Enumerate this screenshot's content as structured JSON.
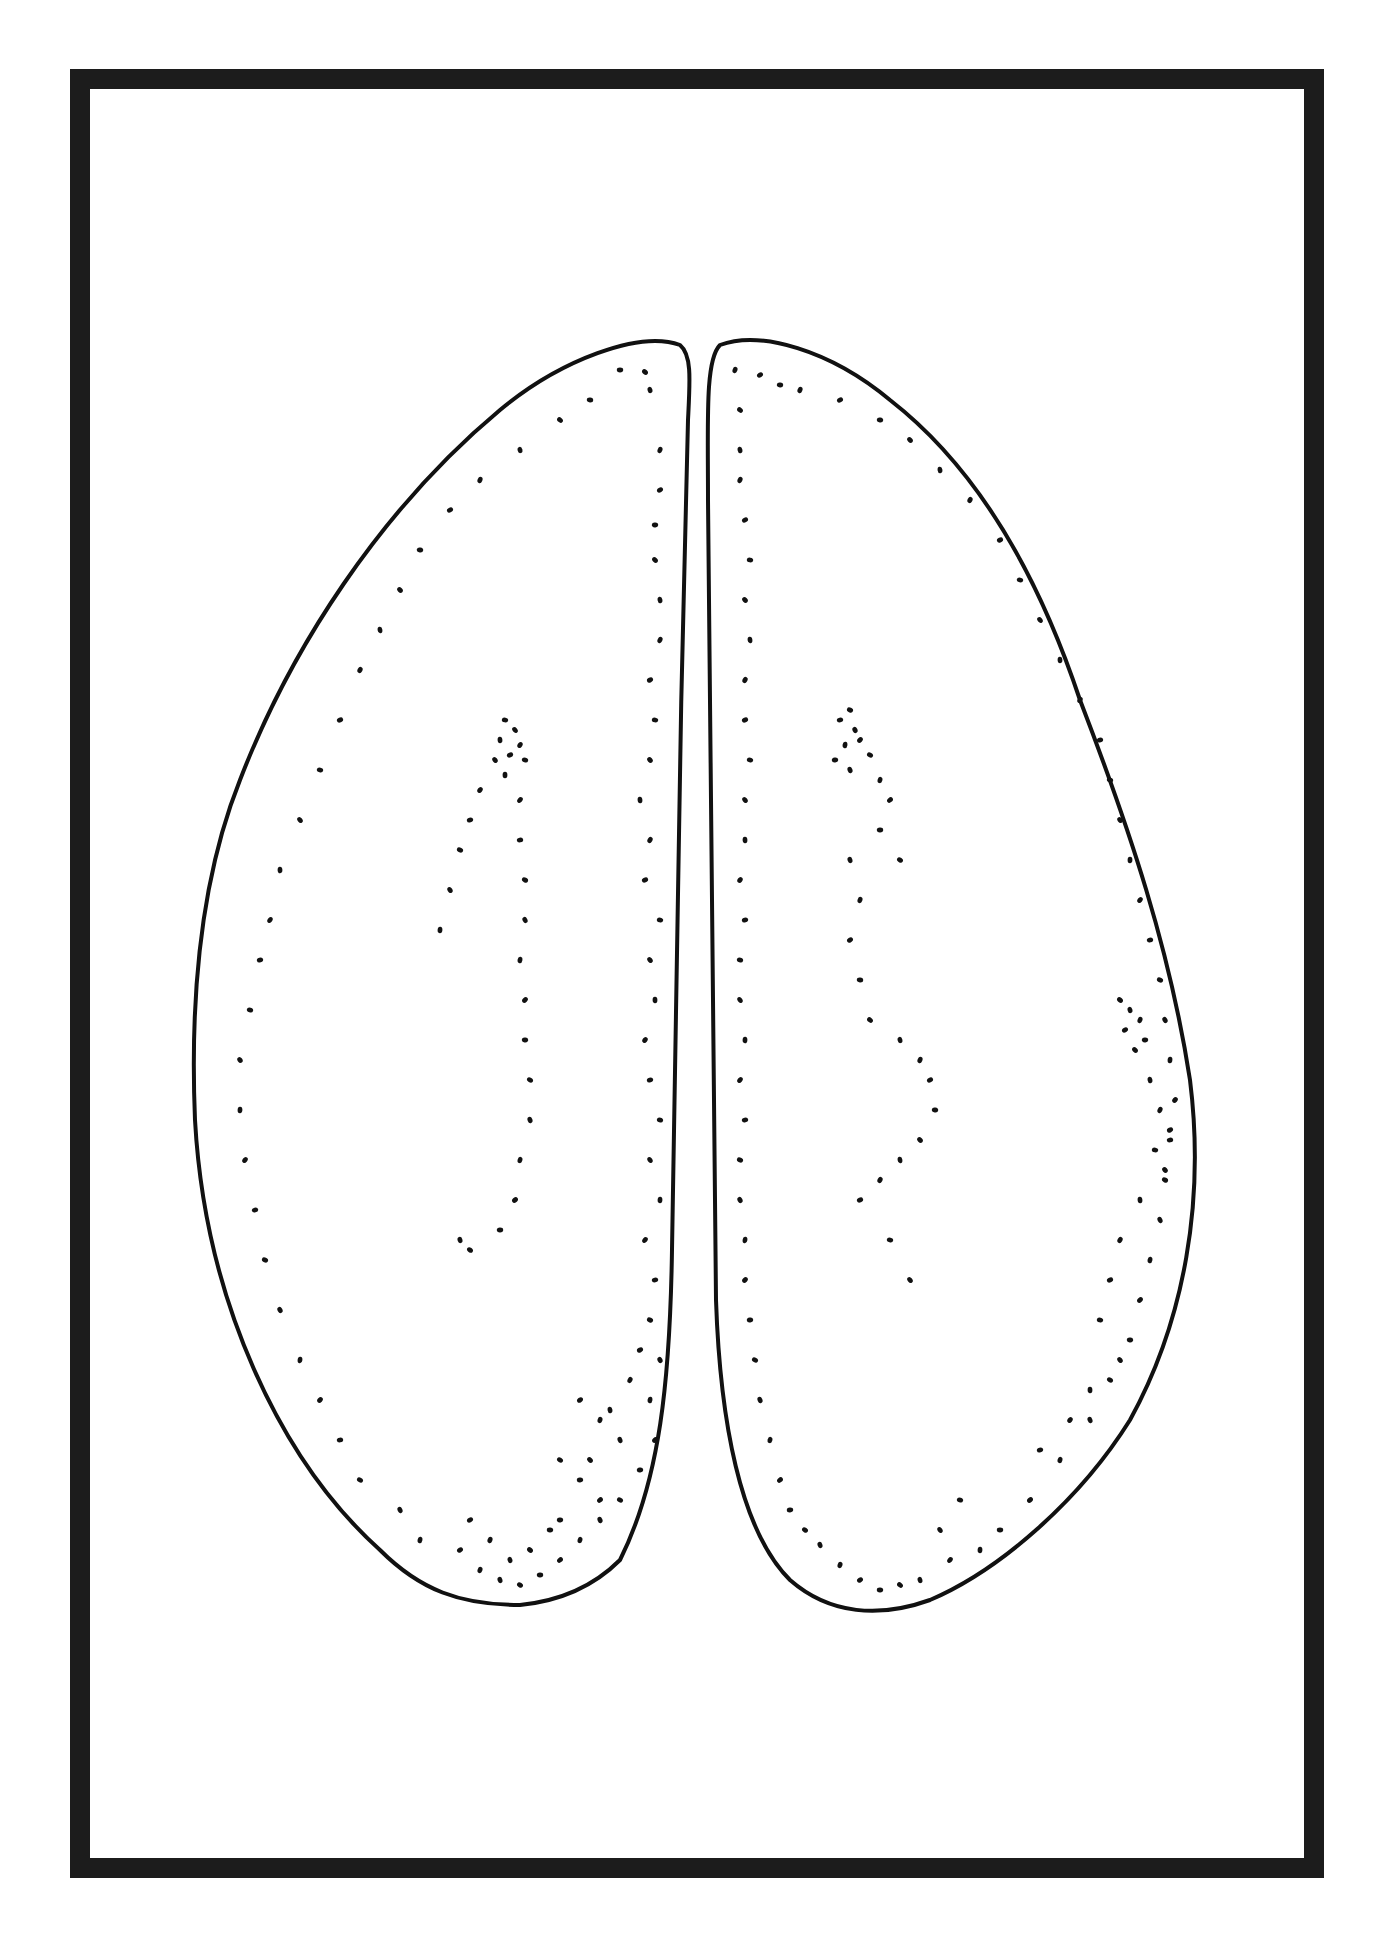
{
  "figure": {
    "frame_color": "#1c1c1c",
    "stroke_color": "#111111",
    "background": "#ffffff",
    "left_lobe_path": "M 680 345 C 640 330 560 360 500 410 C 380 510 290 650 240 780 C 200 880 190 1000 195 1120 C 205 1300 280 1460 380 1550 C 420 1590 460 1605 520 1605 C 570 1600 600 1580 620 1560 C 660 1480 670 1380 672 1250 C 675 1050 680 700 688 420 C 690 380 692 355 680 345 Z",
    "right_lobe_path": "M 720 345 C 760 330 830 350 890 400 C 980 470 1040 580 1080 700 C 1130 830 1170 950 1190 1080 C 1205 1200 1185 1320 1130 1420 C 1080 1500 1000 1570 930 1600 C 880 1618 830 1615 790 1580 C 740 1530 720 1420 716 1300 C 712 1100 710 800 708 500 C 708 420 705 360 720 345 Z",
    "dots": [
      [
        620,
        370
      ],
      [
        645,
        372
      ],
      [
        650,
        390
      ],
      [
        660,
        450
      ],
      [
        660,
        490
      ],
      [
        655,
        525
      ],
      [
        655,
        560
      ],
      [
        660,
        600
      ],
      [
        660,
        640
      ],
      [
        650,
        680
      ],
      [
        655,
        720
      ],
      [
        650,
        760
      ],
      [
        640,
        800
      ],
      [
        650,
        840
      ],
      [
        645,
        880
      ],
      [
        660,
        920
      ],
      [
        650,
        960
      ],
      [
        655,
        1000
      ],
      [
        645,
        1040
      ],
      [
        650,
        1080
      ],
      [
        660,
        1120
      ],
      [
        650,
        1160
      ],
      [
        660,
        1200
      ],
      [
        645,
        1240
      ],
      [
        655,
        1280
      ],
      [
        650,
        1320
      ],
      [
        660,
        1360
      ],
      [
        650,
        1400
      ],
      [
        655,
        1440
      ],
      [
        640,
        1470
      ],
      [
        620,
        1500
      ],
      [
        600,
        1520
      ],
      [
        580,
        1540
      ],
      [
        560,
        1560
      ],
      [
        540,
        1575
      ],
      [
        520,
        1585
      ],
      [
        500,
        1580
      ],
      [
        480,
        1570
      ],
      [
        460,
        1550
      ],
      [
        590,
        400
      ],
      [
        560,
        420
      ],
      [
        520,
        450
      ],
      [
        480,
        480
      ],
      [
        450,
        510
      ],
      [
        420,
        550
      ],
      [
        400,
        590
      ],
      [
        380,
        630
      ],
      [
        360,
        670
      ],
      [
        340,
        720
      ],
      [
        320,
        770
      ],
      [
        300,
        820
      ],
      [
        280,
        870
      ],
      [
        270,
        920
      ],
      [
        260,
        960
      ],
      [
        250,
        1010
      ],
      [
        240,
        1060
      ],
      [
        240,
        1110
      ],
      [
        245,
        1160
      ],
      [
        255,
        1210
      ],
      [
        265,
        1260
      ],
      [
        280,
        1310
      ],
      [
        300,
        1360
      ],
      [
        320,
        1400
      ],
      [
        340,
        1440
      ],
      [
        360,
        1480
      ],
      [
        400,
        1510
      ],
      [
        420,
        1540
      ],
      [
        600,
        1500
      ],
      [
        580,
        1480
      ],
      [
        560,
        1460
      ],
      [
        620,
        1440
      ],
      [
        600,
        1420
      ],
      [
        580,
        1400
      ],
      [
        550,
        1530
      ],
      [
        530,
        1550
      ],
      [
        510,
        1560
      ],
      [
        490,
        1540
      ],
      [
        470,
        1520
      ],
      [
        560,
        1520
      ],
      [
        590,
        1460
      ],
      [
        610,
        1410
      ],
      [
        630,
        1380
      ],
      [
        640,
        1350
      ],
      [
        505,
        720
      ],
      [
        515,
        730
      ],
      [
        500,
        740
      ],
      [
        520,
        745
      ],
      [
        510,
        755
      ],
      [
        525,
        760
      ],
      [
        495,
        760
      ],
      [
        505,
        775
      ],
      [
        480,
        790
      ],
      [
        470,
        820
      ],
      [
        460,
        850
      ],
      [
        450,
        890
      ],
      [
        440,
        930
      ],
      [
        520,
        800
      ],
      [
        520,
        840
      ],
      [
        525,
        880
      ],
      [
        525,
        920
      ],
      [
        520,
        960
      ],
      [
        525,
        1000
      ],
      [
        525,
        1040
      ],
      [
        530,
        1080
      ],
      [
        530,
        1120
      ],
      [
        520,
        1160
      ],
      [
        515,
        1200
      ],
      [
        500,
        1230
      ],
      [
        470,
        1250
      ],
      [
        460,
        1240
      ],
      [
        735,
        370
      ],
      [
        760,
        375
      ],
      [
        780,
        385
      ],
      [
        740,
        410
      ],
      [
        740,
        450
      ],
      [
        740,
        480
      ],
      [
        745,
        520
      ],
      [
        750,
        560
      ],
      [
        745,
        600
      ],
      [
        750,
        640
      ],
      [
        745,
        680
      ],
      [
        745,
        720
      ],
      [
        750,
        760
      ],
      [
        745,
        800
      ],
      [
        745,
        840
      ],
      [
        740,
        880
      ],
      [
        745,
        920
      ],
      [
        740,
        960
      ],
      [
        740,
        1000
      ],
      [
        745,
        1040
      ],
      [
        740,
        1080
      ],
      [
        745,
        1120
      ],
      [
        740,
        1160
      ],
      [
        740,
        1200
      ],
      [
        745,
        1240
      ],
      [
        745,
        1280
      ],
      [
        750,
        1320
      ],
      [
        755,
        1360
      ],
      [
        760,
        1400
      ],
      [
        770,
        1440
      ],
      [
        780,
        1480
      ],
      [
        790,
        1510
      ],
      [
        805,
        1530
      ],
      [
        820,
        1545
      ],
      [
        840,
        1565
      ],
      [
        860,
        1580
      ],
      [
        880,
        1590
      ],
      [
        900,
        1585
      ],
      [
        920,
        1580
      ],
      [
        800,
        390
      ],
      [
        840,
        400
      ],
      [
        880,
        420
      ],
      [
        910,
        440
      ],
      [
        940,
        470
      ],
      [
        970,
        500
      ],
      [
        1000,
        540
      ],
      [
        1020,
        580
      ],
      [
        1040,
        620
      ],
      [
        1060,
        660
      ],
      [
        1080,
        700
      ],
      [
        1100,
        740
      ],
      [
        1110,
        780
      ],
      [
        1120,
        820
      ],
      [
        1130,
        860
      ],
      [
        1140,
        900
      ],
      [
        1150,
        940
      ],
      [
        1160,
        980
      ],
      [
        1165,
        1020
      ],
      [
        1170,
        1060
      ],
      [
        1175,
        1100
      ],
      [
        1170,
        1140
      ],
      [
        1165,
        1180
      ],
      [
        1160,
        1220
      ],
      [
        1150,
        1260
      ],
      [
        1140,
        1300
      ],
      [
        1130,
        1340
      ],
      [
        1110,
        1380
      ],
      [
        1090,
        1420
      ],
      [
        1060,
        1460
      ],
      [
        1030,
        1500
      ],
      [
        1000,
        1530
      ],
      [
        1120,
        1000
      ],
      [
        1130,
        1010
      ],
      [
        1140,
        1020
      ],
      [
        1125,
        1030
      ],
      [
        1145,
        1040
      ],
      [
        1135,
        1050
      ],
      [
        1150,
        1080
      ],
      [
        1160,
        1110
      ],
      [
        1170,
        1130
      ],
      [
        1155,
        1150
      ],
      [
        1165,
        1170
      ],
      [
        1140,
        1200
      ],
      [
        1120,
        1240
      ],
      [
        1110,
        1280
      ],
      [
        1100,
        1320
      ],
      [
        1120,
        1360
      ],
      [
        1090,
        1390
      ],
      [
        1070,
        1420
      ],
      [
        1040,
        1450
      ],
      [
        960,
        1500
      ],
      [
        940,
        1530
      ],
      [
        980,
        1550
      ],
      [
        950,
        1560
      ],
      [
        840,
        720
      ],
      [
        850,
        710
      ],
      [
        855,
        730
      ],
      [
        845,
        745
      ],
      [
        860,
        740
      ],
      [
        835,
        760
      ],
      [
        870,
        755
      ],
      [
        850,
        770
      ],
      [
        880,
        780
      ],
      [
        890,
        800
      ],
      [
        880,
        830
      ],
      [
        900,
        860
      ],
      [
        850,
        860
      ],
      [
        860,
        900
      ],
      [
        850,
        940
      ],
      [
        860,
        980
      ],
      [
        870,
        1020
      ],
      [
        900,
        1040
      ],
      [
        920,
        1060
      ],
      [
        930,
        1080
      ],
      [
        935,
        1110
      ],
      [
        920,
        1140
      ],
      [
        900,
        1160
      ],
      [
        880,
        1180
      ],
      [
        860,
        1200
      ],
      [
        890,
        1240
      ],
      [
        910,
        1280
      ]
    ]
  }
}
